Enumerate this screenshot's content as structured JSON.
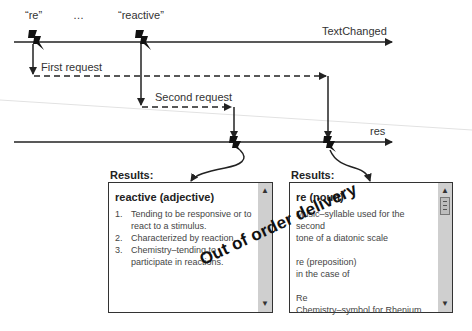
{
  "timeline_top": {
    "label": "TextChanged",
    "events": [
      {
        "label": "“re”"
      },
      {
        "label": "…"
      },
      {
        "label": "“reactive”"
      }
    ]
  },
  "requests": {
    "first": "First request",
    "second": "Second request"
  },
  "timeline_bottom": {
    "label": "res"
  },
  "results_left": {
    "heading": "Results:",
    "title": "reactive (adjective)",
    "items": [
      {
        "num": "1.",
        "text": "Tending to be responsive or to react to a stimulus."
      },
      {
        "num": "2.",
        "text": "Characterized by reaction."
      },
      {
        "num": "3.",
        "text": "Chemistry–tending to participate in reactions."
      }
    ],
    "scroll_up": "▲",
    "scroll_down": "▼"
  },
  "results_right": {
    "heading": "Results:",
    "title": "re (noun)",
    "entries": [
      {
        "line1": "Music–syllable used for the second",
        "line2": "tone of a diatonic scale"
      },
      {
        "line1": "re (preposition)",
        "line2": "in the case of"
      },
      {
        "line1": "Re",
        "line2": "Chemistry–symbol for Rhenium"
      }
    ],
    "scroll_up": "▲",
    "scroll_down": "▼"
  },
  "annotation": "Out of order delivery",
  "colors": {
    "line": "#222222",
    "scrollbar": "#cfcfcf",
    "text": "#333333"
  }
}
